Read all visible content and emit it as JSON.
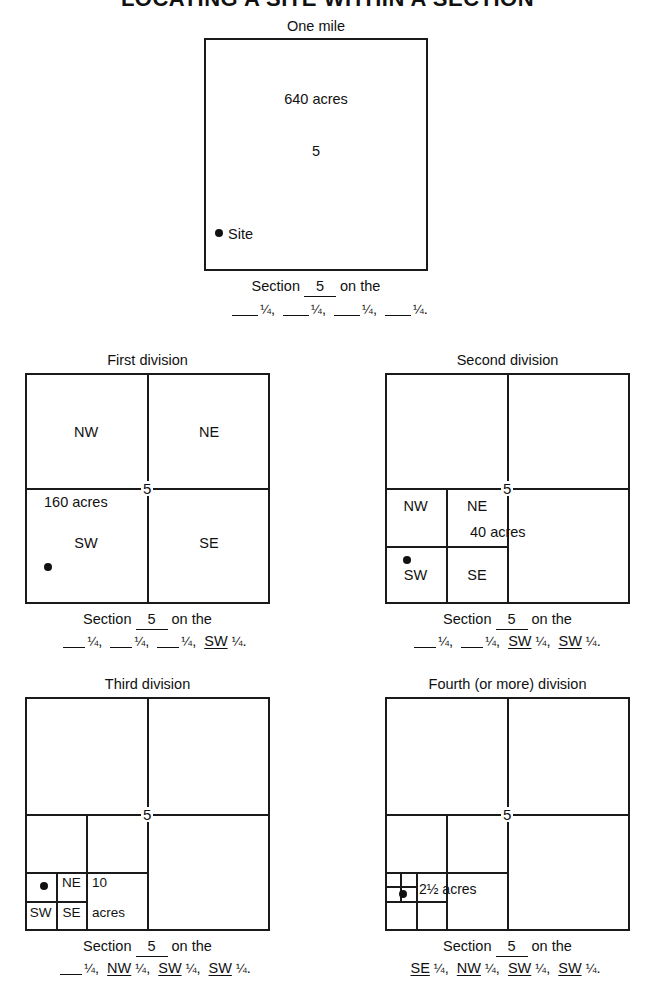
{
  "title": "LOCATING A SITE WITHIN A SECTION",
  "fraction": "¼",
  "site_dot": "site-marker",
  "panels": {
    "main": {
      "top_label": "One mile",
      "acres": "640 acres",
      "section_number": "5",
      "site_label": "Site",
      "caption_line1_prefix": "Section",
      "caption_line1_number": "5",
      "caption_line1_suffix": "on the",
      "caption_quarters": [
        {
          "label": "",
          "underlined": false
        },
        {
          "label": "",
          "underlined": false
        },
        {
          "label": "",
          "underlined": false
        },
        {
          "label": "",
          "underlined": false
        }
      ]
    },
    "first": {
      "heading": "First division",
      "section_number": "5",
      "acres": "160 acres",
      "quadrants": [
        "NW",
        "NE",
        "SW",
        "SE"
      ],
      "caption_line1_prefix": "Section",
      "caption_line1_number": "5",
      "caption_line1_suffix": "on the",
      "caption_quarters": [
        {
          "label": "",
          "underlined": false
        },
        {
          "label": "",
          "underlined": false
        },
        {
          "label": "",
          "underlined": false
        },
        {
          "label": "SW",
          "underlined": true
        }
      ]
    },
    "second": {
      "heading": "Second division",
      "section_number": "5",
      "acres": "40 acres",
      "quadrants": [
        "NW",
        "NE",
        "SW",
        "SE"
      ],
      "caption_line1_prefix": "Section",
      "caption_line1_number": "5",
      "caption_line1_suffix": "on the",
      "caption_quarters": [
        {
          "label": "",
          "underlined": false
        },
        {
          "label": "",
          "underlined": false
        },
        {
          "label": "SW",
          "underlined": true
        },
        {
          "label": "SW",
          "underlined": true
        }
      ]
    },
    "third": {
      "heading": "Third division",
      "section_number": "5",
      "acres_line1": "10",
      "acres_line2": "acres",
      "quadrants": [
        "NE",
        "SW",
        "SE"
      ],
      "caption_line1_prefix": "Section",
      "caption_line1_number": "5",
      "caption_line1_suffix": "on the",
      "caption_quarters": [
        {
          "label": "",
          "underlined": false
        },
        {
          "label": "NW",
          "underlined": true
        },
        {
          "label": "SW",
          "underlined": true
        },
        {
          "label": "SW",
          "underlined": true
        }
      ]
    },
    "fourth": {
      "heading": "Fourth (or more) division",
      "section_number": "5",
      "acres": "2½ acres",
      "caption_line1_prefix": "Section",
      "caption_line1_number": "5",
      "caption_line1_suffix": "on the",
      "caption_quarters": [
        {
          "label": "SE",
          "underlined": true
        },
        {
          "label": "NW",
          "underlined": true
        },
        {
          "label": "SW",
          "underlined": true
        },
        {
          "label": "SW",
          "underlined": true
        }
      ]
    }
  }
}
